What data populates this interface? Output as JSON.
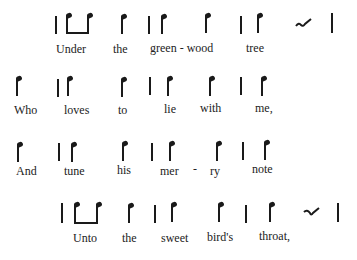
{
  "lines": [
    {
      "lyrics": [
        "Under",
        "the",
        "green - wood",
        "tree"
      ]
    },
    {
      "lyrics": [
        "Who",
        "loves",
        "to",
        "lie",
        "with",
        "me,"
      ]
    },
    {
      "lyrics": [
        "And",
        "tune",
        "his",
        "mer",
        "-",
        "ry",
        "note"
      ]
    },
    {
      "lyrics": [
        "Unto",
        "the",
        "sweet",
        "bird's",
        "throat,"
      ]
    }
  ],
  "icons": {
    "bar_line": "vertical-bar",
    "note": "quarter-note-stem",
    "beamed_pair": "two-beamed-notes",
    "rest": "rest-squiggle"
  }
}
